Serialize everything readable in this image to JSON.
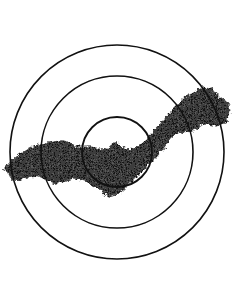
{
  "figure": {
    "name": "concentric-zone-plume-diagram",
    "background_color": "#ffffff",
    "width": 237,
    "height": 285,
    "caption": "",
    "title": ""
  },
  "chart_data": {
    "type": "scatter",
    "title": "",
    "subtitle": "",
    "xlabel": "",
    "ylabel": "",
    "grid": false,
    "legend": "none",
    "xlim": [
      0,
      237
    ],
    "ylim": [
      0,
      285
    ],
    "center": {
      "x": 117,
      "y": 152
    },
    "rings": [
      {
        "label": "outer-ring",
        "radius": 107,
        "stroke": "#111111",
        "stroke_width": 1.6
      },
      {
        "label": "middle-ring",
        "radius": 76,
        "stroke": "#111111",
        "stroke_width": 1.6
      },
      {
        "label": "inner-ring",
        "radius": 35,
        "stroke": "#111111",
        "stroke_width": 1.8
      }
    ],
    "band": {
      "label": "dark-plume-band",
      "fill": "#3c3c3c",
      "texture": "dithered-halftone",
      "trend": "lower-left to upper-right",
      "left_extent_x": 4,
      "right_extent_x": 231,
      "top_extent_y": 86,
      "bottom_extent_y": 197,
      "outline_points": [
        [
          4,
          168
        ],
        [
          12,
          160
        ],
        [
          22,
          152
        ],
        [
          32,
          146
        ],
        [
          42,
          143
        ],
        [
          52,
          142
        ],
        [
          60,
          140
        ],
        [
          68,
          141
        ],
        [
          74,
          145
        ],
        [
          80,
          147
        ],
        [
          90,
          146
        ],
        [
          98,
          148
        ],
        [
          104,
          150
        ],
        [
          110,
          146
        ],
        [
          116,
          141
        ],
        [
          120,
          146
        ],
        [
          128,
          149
        ],
        [
          138,
          146
        ],
        [
          150,
          136
        ],
        [
          160,
          124
        ],
        [
          168,
          114
        ],
        [
          176,
          106
        ],
        [
          184,
          98
        ],
        [
          192,
          92
        ],
        [
          200,
          88
        ],
        [
          208,
          86
        ],
        [
          214,
          90
        ],
        [
          218,
          97
        ],
        [
          224,
          100
        ],
        [
          229,
          104
        ],
        [
          231,
          112
        ],
        [
          228,
          120
        ],
        [
          222,
          124
        ],
        [
          214,
          126
        ],
        [
          206,
          124
        ],
        [
          200,
          126
        ],
        [
          194,
          130
        ],
        [
          188,
          134
        ],
        [
          182,
          132
        ],
        [
          176,
          134
        ],
        [
          170,
          140
        ],
        [
          164,
          148
        ],
        [
          158,
          156
        ],
        [
          152,
          162
        ],
        [
          146,
          168
        ],
        [
          140,
          174
        ],
        [
          134,
          180
        ],
        [
          128,
          186
        ],
        [
          122,
          192
        ],
        [
          116,
          196
        ],
        [
          110,
          197
        ],
        [
          104,
          194
        ],
        [
          98,
          188
        ],
        [
          92,
          184
        ],
        [
          86,
          182
        ],
        [
          80,
          180
        ],
        [
          74,
          178
        ],
        [
          68,
          180
        ],
        [
          62,
          182
        ],
        [
          56,
          184
        ],
        [
          50,
          183
        ],
        [
          44,
          179
        ],
        [
          38,
          176
        ],
        [
          32,
          176
        ],
        [
          26,
          178
        ],
        [
          20,
          180
        ],
        [
          14,
          180
        ],
        [
          8,
          176
        ]
      ]
    }
  }
}
